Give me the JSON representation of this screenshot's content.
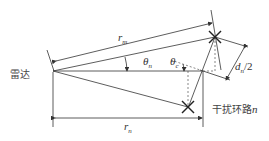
{
  "diagram": {
    "radar_label": "雷达",
    "jammer_label": "干扰环路",
    "jammer_index": "n",
    "r_m": {
      "base": "r",
      "sub": "m"
    },
    "r_n": {
      "base": "r",
      "sub": "n"
    },
    "theta_n": {
      "base": "θ",
      "sub": "n"
    },
    "theta_c": {
      "base": "θ",
      "sub": "c"
    },
    "d_half": {
      "base": "d",
      "sub": "n",
      "suffix": "/2"
    }
  }
}
